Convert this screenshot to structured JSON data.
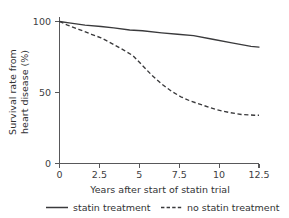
{
  "chart_data": {
    "type": "line",
    "title": "",
    "xlabel": "Years after start of statin trial",
    "ylabel_line1": "Survival rate from",
    "ylabel_line2": "heart disease (%)",
    "ylabel": "Survival rate from heart disease (%)",
    "xlim": [
      0,
      12.5
    ],
    "ylim": [
      0,
      100
    ],
    "grid": false,
    "legend_position": "bottom",
    "xticks": [
      0,
      2.5,
      5,
      7.5,
      10,
      12.5
    ],
    "xtick_labels": [
      "0",
      "2.5",
      "5",
      "7.5",
      "10",
      "12.5"
    ],
    "yticks": [
      0,
      50,
      100
    ],
    "ytick_labels": [
      "0",
      "50",
      "100"
    ],
    "series": [
      {
        "name": "statin treatment",
        "style": "solid",
        "color": "#3a3a3c",
        "x": [
          0,
          0.6,
          1.6,
          2.6,
          3.4,
          4.4,
          5.2,
          6.4,
          7.4,
          8.4,
          9.6,
          10.8,
          12.0,
          12.5
        ],
        "values": [
          100,
          99,
          97.5,
          96.5,
          95.5,
          94,
          93.5,
          92,
          91,
          90,
          87.5,
          85,
          82.5,
          82
        ]
      },
      {
        "name": "no statin treatment",
        "style": "dashed",
        "color": "#3a3a3c",
        "x": [
          0,
          0.5,
          1.2,
          2.0,
          2.6,
          3.2,
          4.0,
          4.6,
          5.2,
          5.8,
          6.4,
          7.0,
          7.6,
          8.2,
          9.0,
          9.8,
          10.6,
          11.4,
          12.2,
          12.5
        ],
        "values": [
          100,
          97.5,
          94.5,
          91,
          88.5,
          85,
          80,
          76,
          69,
          62,
          56,
          51,
          47,
          44,
          41,
          38,
          36,
          34.5,
          34,
          34
        ]
      }
    ]
  },
  "legend": {
    "items": [
      {
        "label": "statin treatment",
        "style": "solid"
      },
      {
        "label": "no statin treatment",
        "style": "dashed"
      }
    ]
  }
}
